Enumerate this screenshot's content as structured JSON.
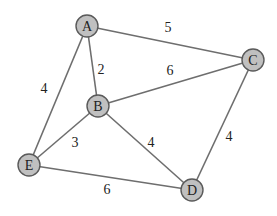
{
  "graph": {
    "type": "weighted-undirected-graph",
    "colors": {
      "node_fill": "#c0c0c0",
      "node_stroke": "#5a5a5a",
      "edge": "#6e6e6e",
      "text": "#222222"
    },
    "nodes": [
      {
        "id": "A",
        "label": "A",
        "x": 87,
        "y": 26
      },
      {
        "id": "B",
        "label": "B",
        "x": 98,
        "y": 106
      },
      {
        "id": "C",
        "label": "C",
        "x": 253,
        "y": 60
      },
      {
        "id": "D",
        "label": "D",
        "x": 192,
        "y": 190
      },
      {
        "id": "E",
        "label": "E",
        "x": 29,
        "y": 165
      }
    ],
    "edges": [
      {
        "from": "A",
        "to": "C",
        "weight": "5",
        "label_x": 168,
        "label_y": 27
      },
      {
        "from": "A",
        "to": "B",
        "weight": "2",
        "label_x": 101,
        "label_y": 69
      },
      {
        "from": "B",
        "to": "C",
        "weight": "6",
        "label_x": 170,
        "label_y": 70
      },
      {
        "from": "A",
        "to": "E",
        "weight": "4",
        "label_x": 44,
        "label_y": 88
      },
      {
        "from": "B",
        "to": "E",
        "weight": "3",
        "label_x": 75,
        "label_y": 142
      },
      {
        "from": "B",
        "to": "D",
        "weight": "4",
        "label_x": 151,
        "label_y": 142
      },
      {
        "from": "C",
        "to": "D",
        "weight": "4",
        "label_x": 229,
        "label_y": 136
      },
      {
        "from": "E",
        "to": "D",
        "weight": "6",
        "label_x": 107,
        "label_y": 189
      }
    ]
  }
}
